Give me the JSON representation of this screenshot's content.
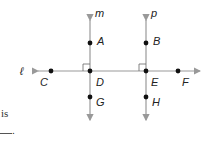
{
  "diagram": {
    "lines": [
      {
        "name": "m",
        "label": "m"
      },
      {
        "name": "p",
        "label": "p"
      },
      {
        "name": "l",
        "label": "ℓ"
      }
    ],
    "points": {
      "A": "A",
      "B": "B",
      "C": "C",
      "D": "D",
      "E": "E",
      "F": "F",
      "G": "G",
      "H": "H"
    },
    "line_color": "#999999",
    "point_color": "#111111"
  },
  "text": {
    "fragment_is": "is",
    "blank_end": "."
  }
}
